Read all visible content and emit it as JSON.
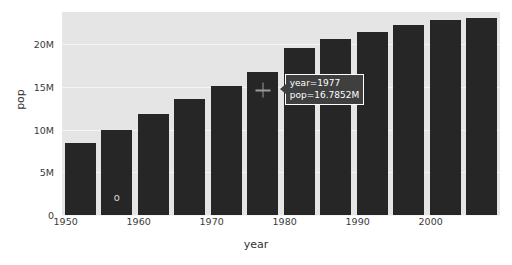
{
  "chart_data": {
    "type": "bar",
    "title": "",
    "xlabel": "year",
    "ylabel": "pop",
    "categories": [
      1952,
      1957,
      1962,
      1967,
      1972,
      1977,
      1982,
      1987,
      1992,
      1997,
      2002,
      2007
    ],
    "values": [
      8.5,
      10.0,
      11.8,
      13.6,
      15.1,
      16.7852,
      19.6,
      20.6,
      21.5,
      22.3,
      22.9,
      23.1
    ],
    "value_unit": "M",
    "xlim": [
      1949.5,
      2009.5
    ],
    "ylim": [
      0,
      23.8
    ],
    "xticks": [
      1950,
      1960,
      1970,
      1980,
      1990,
      2000
    ],
    "xtick_labels": [
      "1950",
      "1960",
      "1970",
      "1980",
      "1990",
      "2000"
    ],
    "yticks": [
      0,
      5,
      10,
      15,
      20
    ],
    "ytick_labels": [
      "0",
      "5M",
      "10M",
      "15M",
      "20M"
    ],
    "grid": true,
    "legend": null,
    "bar_color": "#262626",
    "plot_background": "#e5e5e5",
    "gridline_color": "#f4f4f4"
  },
  "tooltip": {
    "line1": "year=1977",
    "line2": "pop=16.7852M",
    "anchor_year": 1977,
    "anchor_value": 16.7852
  },
  "cursor": {
    "name": "crosshair",
    "year": 1977,
    "value": 14.6
  },
  "point_marker": {
    "glyph": "o",
    "year": 1957,
    "value": 2.1
  }
}
